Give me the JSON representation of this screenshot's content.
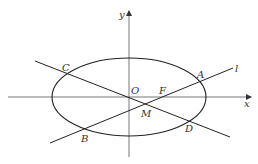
{
  "figure": {
    "type": "ellipse-with-chords",
    "colors": {
      "stroke": "#222222",
      "axis": "#555555",
      "label": "#333333"
    },
    "axes": {
      "x_label": "x",
      "y_label": "y",
      "origin_label": "O"
    },
    "ellipse": {
      "cx": 129,
      "cy": 97,
      "rx": 77,
      "ry": 39
    },
    "lines": [
      {
        "name": "l",
        "label": "l",
        "through": [
          "B",
          "M",
          "F",
          "A"
        ]
      },
      {
        "name": "CD",
        "label": "",
        "through": [
          "C",
          "O",
          "M",
          "D"
        ]
      }
    ],
    "points": [
      {
        "name": "A",
        "label": "A"
      },
      {
        "name": "B",
        "label": "B"
      },
      {
        "name": "C",
        "label": "C"
      },
      {
        "name": "D",
        "label": "D"
      },
      {
        "name": "F",
        "label": "F"
      },
      {
        "name": "M",
        "label": "M"
      },
      {
        "name": "O",
        "label": "O"
      }
    ]
  }
}
